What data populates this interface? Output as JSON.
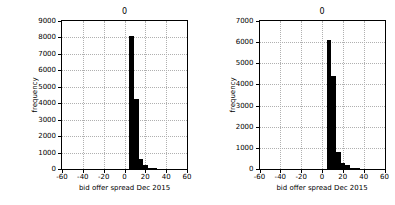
{
  "figure": {
    "background": "#ffffff",
    "bar_color": "#000000",
    "grid_color": "#b0b0b0",
    "axis_color": "#000000"
  },
  "chart_data": [
    {
      "type": "bar",
      "panel": "left",
      "title": "0",
      "xlabel": "bid offer spread Dec 2015",
      "ylabel": "frequency",
      "xlim": [
        -60,
        60
      ],
      "ylim": [
        0,
        9000
      ],
      "xticks": [
        -60,
        -40,
        -20,
        0,
        20,
        40,
        60
      ],
      "xticklabels": [
        "-60",
        "-40",
        "-20",
        "0",
        "20",
        "40",
        "60"
      ],
      "yticks": [
        0,
        1000,
        2000,
        3000,
        4000,
        5000,
        6000,
        7000,
        8000,
        9000
      ],
      "yticklabels": [
        "0",
        "1000",
        "2000",
        "3000",
        "4000",
        "5000",
        "6000",
        "7000",
        "8000",
        "9000"
      ],
      "grid": true,
      "legend": "none",
      "bin_width": 4.5,
      "bins": [
        {
          "x0": 4.5,
          "x1": 9.0,
          "value": 8080
        },
        {
          "x0": 9.0,
          "x1": 13.5,
          "value": 4250
        },
        {
          "x0": 13.5,
          "x1": 18.0,
          "value": 620
        },
        {
          "x0": 18.0,
          "x1": 22.5,
          "value": 230
        },
        {
          "x0": 22.5,
          "x1": 27.0,
          "value": 60
        },
        {
          "x0": 27.0,
          "x1": 31.5,
          "value": 20
        }
      ]
    },
    {
      "type": "bar",
      "panel": "right",
      "title": "0",
      "xlabel": "bid offer spread Dec 2015",
      "ylabel": "frequency",
      "xlim": [
        -60,
        60
      ],
      "ylim": [
        0,
        7000
      ],
      "xticks": [
        -60,
        -40,
        -20,
        0,
        20,
        40,
        60
      ],
      "xticklabels": [
        "-60",
        "-40",
        "-20",
        "0",
        "20",
        "40",
        "60"
      ],
      "yticks": [
        0,
        1000,
        2000,
        3000,
        4000,
        5000,
        6000,
        7000
      ],
      "yticklabels": [
        "0",
        "1000",
        "2000",
        "3000",
        "4000",
        "5000",
        "6000",
        "7000"
      ],
      "grid": true,
      "legend": "none",
      "bin_width": 4.5,
      "bins": [
        {
          "x0": 4.5,
          "x1": 9.0,
          "value": 6120
        },
        {
          "x0": 9.0,
          "x1": 13.5,
          "value": 4380
        },
        {
          "x0": 13.5,
          "x1": 18.0,
          "value": 790
        },
        {
          "x0": 18.0,
          "x1": 22.5,
          "value": 300
        },
        {
          "x0": 22.5,
          "x1": 27.0,
          "value": 170
        },
        {
          "x0": 27.0,
          "x1": 31.5,
          "value": 60
        },
        {
          "x0": 31.5,
          "x1": 36.0,
          "value": 20
        }
      ]
    }
  ]
}
